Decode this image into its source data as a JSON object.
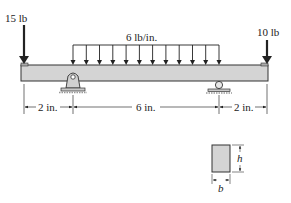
{
  "diagram": {
    "type": "beam-loading",
    "loads": {
      "left_point": {
        "label": "15 lb",
        "magnitude": 15,
        "unit": "lb"
      },
      "right_point": {
        "label": "10 lb",
        "magnitude": 10,
        "unit": "lb"
      },
      "distributed": {
        "label": "6 lb/in.",
        "magnitude": 6,
        "unit": "lb/in."
      }
    },
    "supports": {
      "left": "pin",
      "right": "roller"
    },
    "dimensions": [
      {
        "label": "2 in.",
        "value": 2
      },
      {
        "label": "6 in.",
        "value": 6
      },
      {
        "label": "2 in.",
        "value": 2
      }
    ],
    "cross_section": {
      "height_label": "h",
      "width_label": "b"
    },
    "colors": {
      "beam_fill": "#d4d4d4",
      "line": "#222222"
    }
  }
}
